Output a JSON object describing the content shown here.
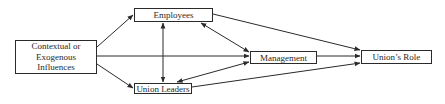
{
  "diagram": {
    "type": "path-diagram",
    "nodes": {
      "context": {
        "label_line1": "Contextual or",
        "label_line2": "Exogenous",
        "label_line3": "Influences"
      },
      "employees": {
        "label": "Employees"
      },
      "union_leaders": {
        "label": "Union Leaders"
      },
      "management": {
        "label": "Management"
      },
      "unions_role": {
        "label": "Union’s Role"
      }
    },
    "edges": [
      {
        "from": "Contextual or Exogenous Influences",
        "to": "Employees",
        "direction": "forward"
      },
      {
        "from": "Contextual or Exogenous Influences",
        "to": "Management",
        "direction": "forward"
      },
      {
        "from": "Contextual or Exogenous Influences",
        "to": "Union Leaders",
        "direction": "forward"
      },
      {
        "from": "Employees",
        "to": "Union Leaders",
        "direction": "bidirectional"
      },
      {
        "from": "Employees",
        "to": "Management",
        "direction": "bidirectional"
      },
      {
        "from": "Union Leaders",
        "to": "Management",
        "direction": "bidirectional"
      },
      {
        "from": "Employees",
        "to": "Union’s Role",
        "direction": "forward"
      },
      {
        "from": "Management",
        "to": "Union’s Role",
        "direction": "forward"
      },
      {
        "from": "Union Leaders",
        "to": "Union’s Role",
        "direction": "forward"
      }
    ],
    "colors": {
      "line": "#2a2a2a",
      "background": "#ffffff"
    }
  }
}
